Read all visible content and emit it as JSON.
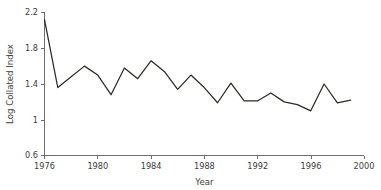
{
  "chart_data": {
    "type": "line",
    "title": "",
    "xlabel": "Year",
    "ylabel": "Log Collated Index",
    "xlim": [
      1976,
      2000
    ],
    "ylim": [
      0.6,
      2.2
    ],
    "grid": false,
    "legend": false,
    "legend_position": "none",
    "xticks": [
      1976,
      1980,
      1984,
      1988,
      1992,
      1996,
      2000
    ],
    "xticklabels": [
      "1976",
      "1980",
      "1984",
      "1988",
      "1992",
      "1996",
      "2000"
    ],
    "yticks": [
      0.6,
      1,
      1.4,
      1.8,
      2.2
    ],
    "yticklabels": [
      "0.6",
      "1",
      "1.4",
      "1.8",
      "2.2"
    ],
    "line_color": "#2d2a26",
    "x": [
      1976,
      1977,
      1978,
      1979,
      1980,
      1981,
      1982,
      1983,
      1984,
      1985,
      1986,
      1987,
      1988,
      1989,
      1990,
      1991,
      1992,
      1993,
      1994,
      1995,
      1996,
      1997,
      1998,
      1999
    ],
    "values": [
      2.12,
      1.36,
      1.48,
      1.6,
      1.5,
      1.28,
      1.58,
      1.46,
      1.66,
      1.54,
      1.34,
      1.5,
      1.36,
      1.19,
      1.41,
      1.21,
      1.21,
      1.3,
      1.2,
      1.17,
      1.1,
      1.4,
      1.19,
      1.22
    ],
    "series": [
      {
        "name": "Log Collated Index",
        "values": [
          2.12,
          1.36,
          1.48,
          1.6,
          1.5,
          1.28,
          1.58,
          1.46,
          1.66,
          1.54,
          1.34,
          1.5,
          1.36,
          1.19,
          1.41,
          1.21,
          1.21,
          1.3,
          1.2,
          1.17,
          1.1,
          1.4,
          1.19,
          1.22
        ]
      }
    ]
  },
  "axis": {
    "y_title": "Log Collated Index",
    "x_title": "Year",
    "y_labels": [
      "2.2",
      "1.8",
      "1.4",
      "1",
      "0.6"
    ],
    "x_labels": [
      "1976",
      "1980",
      "1984",
      "1988",
      "1992",
      "1996",
      "2000"
    ]
  }
}
